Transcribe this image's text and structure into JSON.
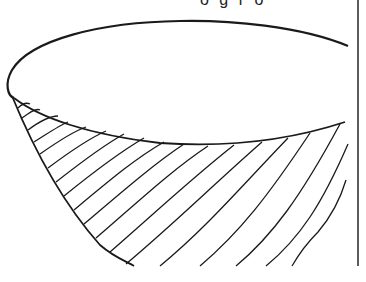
{
  "figure": {
    "caption_fragment": "o g r o",
    "stroke_color": "#1a1a1a",
    "background": "#ffffff",
    "hatch_count": 16
  }
}
